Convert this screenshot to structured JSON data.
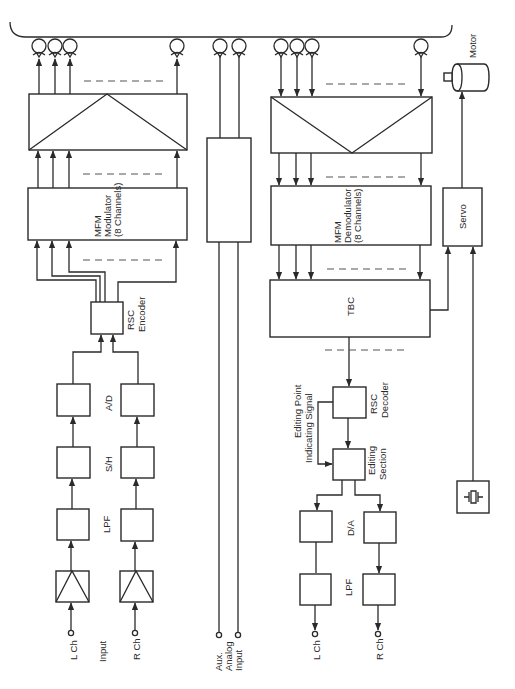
{
  "diagram": {
    "type": "block-diagram",
    "orientation": "rotated-90-ccw",
    "labels": {
      "motor": "Motor",
      "servo": "Servo",
      "mfm_modulator_1": "MFM",
      "mfm_modulator_2": "Modulator",
      "mfm_modulator_3": "(8 Channels)",
      "mfm_demodulator_1": "MFM",
      "mfm_demodulator_2": "Demodulator",
      "mfm_demodulator_3": "(8 Channels)",
      "rsc_encoder_1": "RSC",
      "rsc_encoder_2": "Encoder",
      "rsc_decoder_1": "RSC",
      "rsc_decoder_2": "Decoder",
      "tbc": "TBC",
      "ad": "A/D",
      "sh": "S/H",
      "lpf_in": "LPF",
      "da": "D/A",
      "lpf_out": "LPF",
      "l_ch_in": "L Ch",
      "r_ch_in": "R Ch",
      "input": "Input",
      "aux_1": "Aux.",
      "aux_2": "Analog",
      "aux_3": "Input",
      "editing_point_1": "Editing Point",
      "editing_point_2": "Indicating Signal",
      "editing_section_1": "Editing",
      "editing_section_2": "Section",
      "l_ch_out": "L Ch",
      "r_ch_out": "R Ch"
    },
    "record_chain": [
      "L/R Ch Input",
      "Amplifier",
      "LPF",
      "S/H",
      "A/D",
      "RSC Encoder",
      "MFM Modulator (8 Channels)",
      "Recording Amplifiers",
      "Heads"
    ],
    "playback_chain": [
      "Heads",
      "Playback Amplifiers",
      "MFM Demodulator (8 Channels)",
      "TBC",
      "RSC Decoder",
      "Editing Section",
      "D/A",
      "LPF",
      "L/R Ch Output"
    ],
    "servo_chain": [
      "TBC",
      "Crystal Oscillator",
      "Servo",
      "Motor"
    ],
    "aux_chain": [
      "Aux. Analog Input",
      "Aux Amplifier",
      "Aux Heads"
    ]
  }
}
